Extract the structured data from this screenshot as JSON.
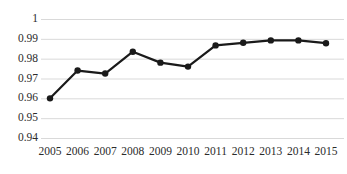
{
  "chart_data": {
    "type": "line",
    "title": "",
    "subtitle": "",
    "xlabel": "",
    "ylabel": "",
    "categories": [
      "2005",
      "2006",
      "2007",
      "2008",
      "2009",
      "2010",
      "2011",
      "2012",
      "2013",
      "2014",
      "2015"
    ],
    "values": [
      0.96,
      0.974,
      0.9725,
      0.9835,
      0.978,
      0.976,
      0.9867,
      0.988,
      0.9892,
      0.9892,
      0.9878
    ],
    "series": [
      {
        "name": "",
        "values": [
          0.96,
          0.974,
          0.9725,
          0.9835,
          0.978,
          0.976,
          0.9867,
          0.988,
          0.9892,
          0.9892,
          0.9878
        ]
      }
    ],
    "ylim": [
      0.94,
      1.0
    ],
    "yticks": [
      0.94,
      0.95,
      0.96,
      0.97,
      0.98,
      0.99,
      1.0
    ],
    "ytick_labels": [
      "0.94",
      "0.95",
      "0.96",
      "0.97",
      "0.98",
      "0.99",
      "1"
    ],
    "xtick_labels": [
      "2005",
      "2006",
      "2007",
      "2008",
      "2009",
      "2010",
      "2011",
      "2012",
      "2013",
      "2014",
      "2015"
    ],
    "grid": true,
    "grid_axis": "y",
    "grid_color": "#d9d9d9",
    "legend": false,
    "legend_position": "none",
    "line_color": "#1a1a1a",
    "line_width": 2.2,
    "marker": "circle",
    "marker_size": 3.2,
    "marker_color": "#1a1a1a",
    "background_color": "#ffffff",
    "text_color": "#2b2b2b",
    "axis_visible": false,
    "annotations": []
  },
  "axes": {
    "y_tick_0": "0.94",
    "y_tick_1": "0.95",
    "y_tick_2": "0.96",
    "y_tick_3": "0.97",
    "y_tick_4": "0.98",
    "y_tick_5": "0.99",
    "y_tick_6": "1",
    "x_tick_0": "2005",
    "x_tick_1": "2006",
    "x_tick_2": "2007",
    "x_tick_3": "2008",
    "x_tick_4": "2009",
    "x_tick_5": "2010",
    "x_tick_6": "2011",
    "x_tick_7": "2012",
    "x_tick_8": "2013",
    "x_tick_9": "2014",
    "x_tick_10": "2015"
  }
}
